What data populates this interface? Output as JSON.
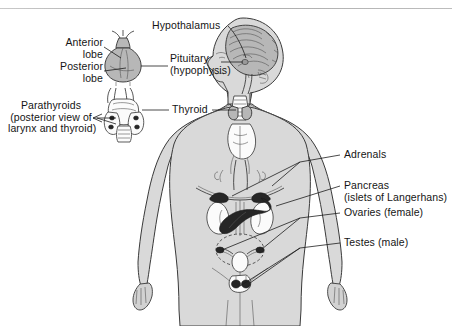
{
  "figure": {
    "type": "anatomical-diagram",
    "background": "#ffffff",
    "body_fill": "#d9d9d9",
    "organ_dark": "#262626",
    "outline": "#333333"
  },
  "labels": {
    "hypothalamus": "Hypothalamus",
    "anterior_lobe": "Anterior\nlobe",
    "posterior_lobe": "Posterior\nlobe",
    "pituitary": "Pituitary\n(hypophysis)",
    "parathyroids": "Parathyroids\n(posterior view of\nlarynx and thyroid)",
    "thyroid": "Thyroid",
    "adrenals": "Adrenals",
    "pancreas": "Pancreas\n(islets of Langerhans)",
    "ovaries": "Ovaries (female)",
    "testes": "Testes (male)"
  },
  "glands": [
    {
      "name": "hypothalamus",
      "region": "brain"
    },
    {
      "name": "pituitary",
      "region": "brain",
      "parts": [
        "anterior lobe",
        "posterior lobe"
      ]
    },
    {
      "name": "thyroid",
      "region": "neck"
    },
    {
      "name": "parathyroids",
      "region": "neck",
      "view": "posterior view of larynx and thyroid"
    },
    {
      "name": "adrenals",
      "region": "abdomen"
    },
    {
      "name": "pancreas",
      "region": "abdomen",
      "detail": "islets of Langerhans"
    },
    {
      "name": "ovaries",
      "region": "pelvis",
      "sex": "female"
    },
    {
      "name": "testes",
      "region": "pelvis",
      "sex": "male"
    }
  ]
}
